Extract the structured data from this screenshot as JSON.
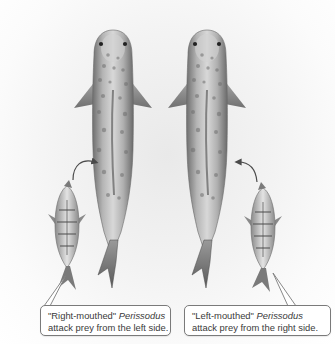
{
  "figure": {
    "colors": {
      "background": "#ffffff",
      "fish_body": "#b9b9b9",
      "fish_spots": "#6e6e6e",
      "arrow": "#4a4a4a",
      "callout_border": "#7a7a7a",
      "callout_text": "#3a3a3a"
    }
  },
  "panels": [
    {
      "id": "left",
      "callout": {
        "quote": "\"Right-mouthed\"",
        "genus": "Perissodus",
        "line2": "attack prey from the left side."
      },
      "arrow_icon": "curved-arrow-icon"
    },
    {
      "id": "right",
      "callout": {
        "quote": "\"Left-mouthed\"",
        "genus": "Perissodus",
        "line2": "attack prey from the right side."
      },
      "arrow_icon": "curved-arrow-icon"
    }
  ]
}
